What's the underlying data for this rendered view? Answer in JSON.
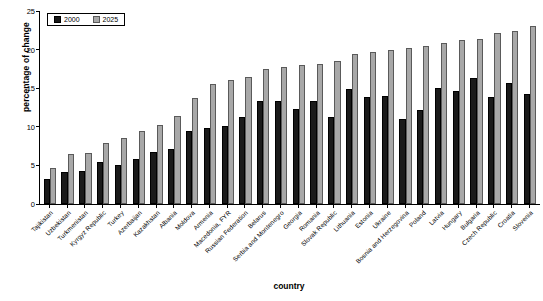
{
  "chart_data": {
    "type": "bar",
    "title": "",
    "xlabel": "country",
    "ylabel": "percentage of change",
    "ylim": [
      0,
      25
    ],
    "yticks": [
      0,
      5,
      10,
      15,
      20,
      25
    ],
    "grid": false,
    "legend_position": "top-left",
    "categories": [
      "Tajikistan",
      "Uzbekistan",
      "Turkmenistan",
      "Kyrgyz Republic",
      "Turkey",
      "Azerbaijan",
      "Kazakhstan",
      "Albania",
      "Moldova",
      "Armenia",
      "Macedonia, FYR",
      "Russian Federation",
      "Belarus",
      "Serbia and Montenegro",
      "Georgia",
      "Romania",
      "Slovak Republic",
      "Lithuania",
      "Estonia",
      "Ukraine",
      "Bosnia and Herzegovina",
      "Poland",
      "Latvia",
      "Hungary",
      "Bulgaria",
      "Czech Republic",
      "Croatia",
      "Slovenia"
    ],
    "series": [
      {
        "name": "2000",
        "color": "#1a1a1a",
        "values": [
          3.3,
          4.2,
          4.3,
          5.5,
          5.0,
          5.8,
          6.8,
          7.1,
          9.4,
          9.9,
          10.1,
          11.3,
          13.4,
          13.3,
          12.3,
          13.4,
          11.3,
          14.9,
          13.9,
          14.0,
          11.0,
          12.2,
          15.0,
          14.6,
          16.3,
          13.9,
          15.7,
          14.2
        ]
      },
      {
        "name": "2025",
        "color": "#a8a8a8",
        "values": [
          4.7,
          6.5,
          6.6,
          7.9,
          8.5,
          9.4,
          10.2,
          11.4,
          13.7,
          15.5,
          16.1,
          16.5,
          17.5,
          17.8,
          18.0,
          18.1,
          18.5,
          19.4,
          19.7,
          20.0,
          20.2,
          20.5,
          20.9,
          21.2,
          21.4,
          22.1,
          22.4,
          23.0
        ]
      }
    ]
  },
  "legend": {
    "items": [
      {
        "label": "2000"
      },
      {
        "label": "2025"
      }
    ]
  }
}
